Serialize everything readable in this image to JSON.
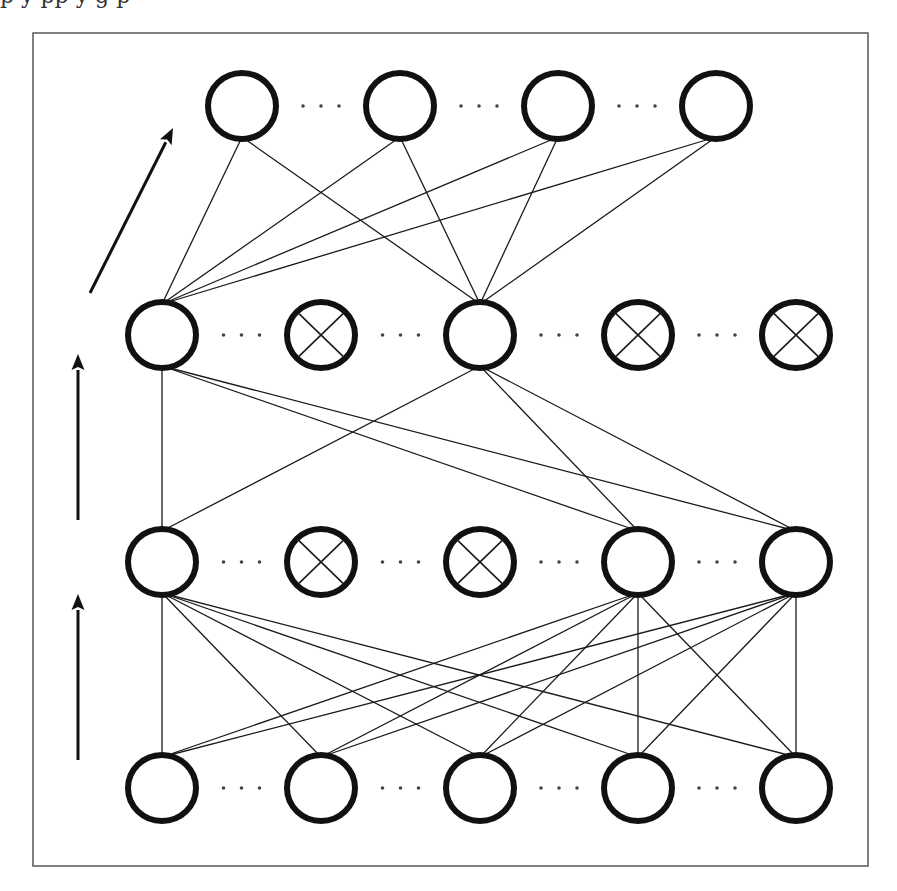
{
  "figure": {
    "clipped_text_above": "p                                                   y pp y g p",
    "frame": {
      "x": 33,
      "y": 33,
      "width": 835,
      "height": 833,
      "stroke": "#555555"
    },
    "colors": {
      "node_stroke": "#111111",
      "edge": "#1a1a1a",
      "dots": "#444444",
      "arrow": "#111111",
      "background": "#ffffff"
    },
    "node_style": {
      "rx": 34,
      "ry": 33,
      "stroke_width": 6
    }
  },
  "layers": [
    {
      "id": "output",
      "label": "Layer 4 (top)",
      "y": 106,
      "nodes": [
        {
          "x": 242,
          "dropped": false
        },
        {
          "x": 400,
          "dropped": false
        },
        {
          "x": 558,
          "dropped": false
        },
        {
          "x": 716,
          "dropped": false
        }
      ]
    },
    {
      "id": "hidden2",
      "label": "Layer 3",
      "y": 335,
      "nodes": [
        {
          "x": 162,
          "dropped": false
        },
        {
          "x": 321,
          "dropped": true
        },
        {
          "x": 480,
          "dropped": false
        },
        {
          "x": 638,
          "dropped": true
        },
        {
          "x": 796,
          "dropped": true
        }
      ]
    },
    {
      "id": "hidden1",
      "label": "Layer 2",
      "y": 562,
      "nodes": [
        {
          "x": 162,
          "dropped": false
        },
        {
          "x": 321,
          "dropped": true
        },
        {
          "x": 480,
          "dropped": true
        },
        {
          "x": 638,
          "dropped": false
        },
        {
          "x": 796,
          "dropped": false
        }
      ]
    },
    {
      "id": "input",
      "label": "Layer 1 (bottom)",
      "y": 788,
      "nodes": [
        {
          "x": 162,
          "dropped": false
        },
        {
          "x": 321,
          "dropped": false
        },
        {
          "x": 480,
          "dropped": false
        },
        {
          "x": 638,
          "dropped": false
        },
        {
          "x": 796,
          "dropped": false
        }
      ]
    }
  ],
  "edges": [
    {
      "from": [
        1,
        0
      ],
      "to": [
        0,
        0
      ]
    },
    {
      "from": [
        1,
        0
      ],
      "to": [
        0,
        1
      ]
    },
    {
      "from": [
        1,
        0
      ],
      "to": [
        0,
        2
      ]
    },
    {
      "from": [
        1,
        0
      ],
      "to": [
        0,
        3
      ]
    },
    {
      "from": [
        1,
        2
      ],
      "to": [
        0,
        0
      ]
    },
    {
      "from": [
        1,
        2
      ],
      "to": [
        0,
        1
      ]
    },
    {
      "from": [
        1,
        2
      ],
      "to": [
        0,
        2
      ]
    },
    {
      "from": [
        1,
        2
      ],
      "to": [
        0,
        3
      ]
    },
    {
      "from": [
        2,
        0
      ],
      "to": [
        1,
        0
      ]
    },
    {
      "from": [
        2,
        0
      ],
      "to": [
        1,
        2
      ]
    },
    {
      "from": [
        2,
        3
      ],
      "to": [
        1,
        0
      ]
    },
    {
      "from": [
        2,
        3
      ],
      "to": [
        1,
        2
      ]
    },
    {
      "from": [
        2,
        4
      ],
      "to": [
        1,
        0
      ]
    },
    {
      "from": [
        2,
        4
      ],
      "to": [
        1,
        2
      ]
    },
    {
      "from": [
        3,
        0
      ],
      "to": [
        2,
        0
      ]
    },
    {
      "from": [
        3,
        1
      ],
      "to": [
        2,
        0
      ]
    },
    {
      "from": [
        3,
        2
      ],
      "to": [
        2,
        0
      ]
    },
    {
      "from": [
        3,
        3
      ],
      "to": [
        2,
        0
      ]
    },
    {
      "from": [
        3,
        4
      ],
      "to": [
        2,
        0
      ]
    },
    {
      "from": [
        3,
        0
      ],
      "to": [
        2,
        3
      ]
    },
    {
      "from": [
        3,
        1
      ],
      "to": [
        2,
        3
      ]
    },
    {
      "from": [
        3,
        2
      ],
      "to": [
        2,
        3
      ]
    },
    {
      "from": [
        3,
        3
      ],
      "to": [
        2,
        3
      ]
    },
    {
      "from": [
        3,
        4
      ],
      "to": [
        2,
        3
      ]
    },
    {
      "from": [
        3,
        0
      ],
      "to": [
        2,
        4
      ]
    },
    {
      "from": [
        3,
        1
      ],
      "to": [
        2,
        4
      ]
    },
    {
      "from": [
        3,
        2
      ],
      "to": [
        2,
        4
      ]
    },
    {
      "from": [
        3,
        3
      ],
      "to": [
        2,
        4
      ]
    },
    {
      "from": [
        3,
        4
      ],
      "to": [
        2,
        4
      ]
    }
  ],
  "arrows": [
    {
      "name": "arrow-input-to-hidden1",
      "x1": 78,
      "y1": 760,
      "x2": 78,
      "y2": 594
    },
    {
      "name": "arrow-hidden1-to-hidden2",
      "x1": 78,
      "y1": 520,
      "x2": 78,
      "y2": 354
    },
    {
      "name": "arrow-hidden2-to-output",
      "x1": 90,
      "y1": 293,
      "x2": 173,
      "y2": 128
    }
  ],
  "ellipsis": {
    "glyph": "· · ·",
    "dot_count": 3,
    "dot_spacing": 18,
    "dot_radius": 1.8
  }
}
